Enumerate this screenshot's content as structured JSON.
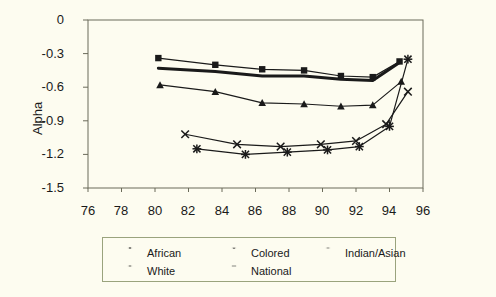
{
  "chart_data": {
    "type": "line",
    "title": "",
    "xlabel": "",
    "ylabel": "Alpha",
    "xlim": [
      76,
      96
    ],
    "ylim": [
      -1.5,
      0
    ],
    "xticks": [
      76,
      78,
      80,
      82,
      84,
      86,
      88,
      90,
      92,
      94,
      96
    ],
    "yticks": [
      0,
      -0.3,
      -0.6,
      -0.9,
      -1.2,
      -1.5
    ],
    "ytick_labels": [
      "0",
      "-0.3",
      "-0.6",
      "-0.9",
      "-1.2",
      "-1.5"
    ],
    "xtick_labels": [
      "76",
      "78",
      "80",
      "82",
      "84",
      "86",
      "88",
      "90",
      "92",
      "94",
      "96"
    ],
    "grid": false,
    "legend_position": "bottom",
    "series": [
      {
        "name": "African",
        "marker": "square",
        "color": "#1a1a1a",
        "x": [
          80.2,
          83.6,
          86.4,
          88.9,
          91.1,
          93.0,
          94.6
        ],
        "y": [
          -0.34,
          -0.4,
          -0.44,
          -0.45,
          -0.5,
          -0.51,
          -0.37
        ]
      },
      {
        "name": "Colored",
        "marker": "triangle",
        "color": "#1a1a1a",
        "x": [
          80.3,
          83.6,
          86.4,
          88.9,
          91.1,
          93.0,
          94.7
        ],
        "y": [
          -0.58,
          -0.64,
          -0.74,
          -0.75,
          -0.77,
          -0.76,
          -0.55
        ]
      },
      {
        "name": "Indian/Asian",
        "marker": "cross",
        "color": "#1a1a1a",
        "x": [
          81.8,
          84.9,
          87.5,
          89.9,
          92.0,
          93.8,
          95.1
        ],
        "y": [
          -1.02,
          -1.11,
          -1.13,
          -1.11,
          -1.08,
          -0.93,
          -0.64
        ]
      },
      {
        "name": "White",
        "marker": "star",
        "color": "#1a1a1a",
        "x": [
          82.5,
          85.4,
          87.9,
          90.3,
          92.2,
          94.0,
          95.1
        ],
        "y": [
          -1.15,
          -1.2,
          -1.18,
          -1.16,
          -1.13,
          -0.95,
          -0.35
        ]
      },
      {
        "name": "National",
        "marker": "none",
        "color": "#1a1a1a",
        "linewidth": 3,
        "x": [
          80.2,
          83.6,
          86.4,
          88.9,
          91.1,
          93.0,
          94.6
        ],
        "y": [
          -0.43,
          -0.46,
          -0.5,
          -0.5,
          -0.53,
          -0.54,
          -0.38
        ]
      }
    ]
  },
  "legend": {
    "items": [
      {
        "label": "African",
        "marker": "square"
      },
      {
        "label": "Colored",
        "marker": "triangle"
      },
      {
        "label": "Indian/Asian",
        "marker": "cross"
      },
      {
        "label": "White",
        "marker": "star"
      },
      {
        "label": "National",
        "marker": "none"
      }
    ]
  },
  "colors": {
    "background": "#fdfcf0",
    "axis": "#6b6b5a",
    "ink": "#1a1a1a",
    "legend_border": "#9aa37d"
  }
}
